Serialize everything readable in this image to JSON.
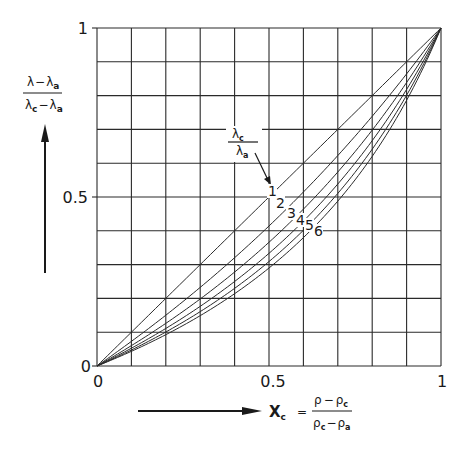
{
  "chart_data": {
    "type": "line",
    "title": "",
    "xlabel": "X_c = (ρ − ρ_c)/(ρ_c − ρ_a)",
    "ylabel": "(λ − λ_a)/(λ_c − λ_a)",
    "xlim": [
      0,
      1
    ],
    "ylim": [
      0,
      1
    ],
    "grid": true,
    "grid_divisions": 10,
    "x_ticks": [
      "0",
      "0.5",
      "1"
    ],
    "y_ticks": [
      "0",
      "0.5",
      "1"
    ],
    "parameter_label": "λc/λa",
    "x": [
      0,
      0.1,
      0.2,
      0.3,
      0.4,
      0.5,
      0.6,
      0.7,
      0.8,
      0.9,
      1.0
    ],
    "series": [
      {
        "name": "1",
        "values": [
          0,
          0.1,
          0.2,
          0.3,
          0.4,
          0.5,
          0.6,
          0.7,
          0.8,
          0.9,
          1.0
        ]
      },
      {
        "name": "2",
        "values": [
          0,
          0.073,
          0.15,
          0.23,
          0.32,
          0.41,
          0.51,
          0.62,
          0.74,
          0.86,
          1.0
        ]
      },
      {
        "name": "3",
        "values": [
          0,
          0.06,
          0.13,
          0.2,
          0.28,
          0.37,
          0.46,
          0.57,
          0.7,
          0.84,
          1.0
        ]
      },
      {
        "name": "4",
        "values": [
          0,
          0.053,
          0.11,
          0.18,
          0.25,
          0.33,
          0.43,
          0.54,
          0.67,
          0.82,
          1.0
        ]
      },
      {
        "name": "5",
        "values": [
          0,
          0.047,
          0.1,
          0.16,
          0.23,
          0.31,
          0.4,
          0.51,
          0.64,
          0.8,
          1.0
        ]
      },
      {
        "name": "6",
        "values": [
          0,
          0.043,
          0.093,
          0.15,
          0.21,
          0.29,
          0.38,
          0.49,
          0.62,
          0.79,
          1.0
        ]
      }
    ],
    "curve_labels": [
      "1",
      "2",
      "3",
      "4",
      "5",
      "6"
    ]
  },
  "axes": {
    "y_top": "1",
    "y_mid": "0.5",
    "y_zero": "0",
    "x_zero": "0",
    "x_mid": "0.5",
    "x_one": "1"
  },
  "ylabel_parts": {
    "num_a": "λ",
    "num_op": "−",
    "num_b": "λ",
    "num_b_sub": "a",
    "den_a": "λ",
    "den_a_sub": "c",
    "den_op": "−",
    "den_b": "λ",
    "den_b_sub": "a"
  },
  "xlabel_parts": {
    "var": "X",
    "var_sub": "c",
    "eq": "=",
    "num_a": "ρ",
    "num_op": "−",
    "num_b": "ρ",
    "num_b_sub": "c",
    "den_a": "ρ",
    "den_a_sub": "c",
    "den_op": "−",
    "den_b": "ρ",
    "den_b_sub": "a"
  },
  "param_parts": {
    "num": "λ",
    "num_sub": "c",
    "den": "λ",
    "den_sub": "a"
  }
}
